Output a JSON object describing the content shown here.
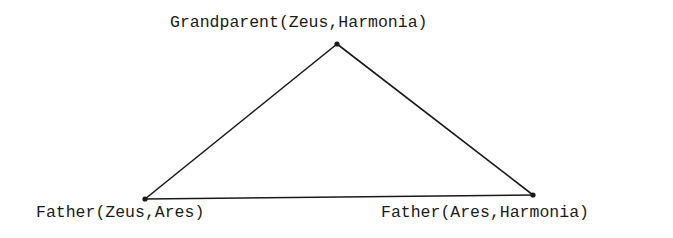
{
  "diagram": {
    "nodes": [
      {
        "id": "top",
        "label": "Grandparent(Zeus,Harmonia)"
      },
      {
        "id": "left",
        "label": "Father(Zeus,Ares)"
      },
      {
        "id": "right",
        "label": "Father(Ares,Harmonia)"
      }
    ],
    "edges": [
      {
        "from": "top",
        "to": "left"
      },
      {
        "from": "top",
        "to": "right"
      },
      {
        "from": "left",
        "to": "right"
      }
    ],
    "colors": {
      "line": "#1a1a1a",
      "text": "#1a1a1a",
      "background": "#ffffff"
    }
  }
}
